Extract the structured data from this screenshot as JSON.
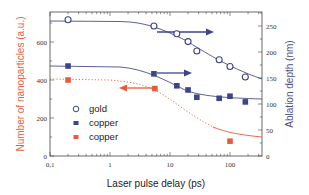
{
  "chart_data": {
    "type": "scatter",
    "title": "",
    "xlabel": "Laser pulse delay (ps)",
    "ylabel": "Number of nanoparticles (a.u.)",
    "ylabel_right": "Ablation depth (nm)",
    "xscale": "log",
    "xlim": [
      0.1,
      300
    ],
    "ylim": [
      0,
      750
    ],
    "ylim_right": [
      0,
      280
    ],
    "x_ticks": [
      "0,1",
      "1",
      "10",
      "100"
    ],
    "y_ticks_left": [
      "0",
      "200",
      "400",
      "600"
    ],
    "y_ticks_right": [
      "0",
      "50",
      "100",
      "150",
      "200",
      "250"
    ],
    "legend": [
      "gold",
      "copper",
      "copper"
    ],
    "legend_position": "lower left inside",
    "series": [
      {
        "name": "gold",
        "axis": "right",
        "marker": "open-circle",
        "color": "#3d4488",
        "x": [
          0.2,
          5.4,
          13,
          20,
          28,
          66,
          100,
          180
        ],
        "y": [
          262,
          250,
          235,
          220,
          202,
          185,
          172,
          152
        ]
      },
      {
        "name": "copper",
        "axis": "right",
        "marker": "filled-square",
        "color": "#3d4488",
        "x": [
          0.2,
          5.4,
          13,
          20,
          28,
          66,
          100,
          180
        ],
        "y": [
          173,
          158,
          135,
          127,
          113,
          111,
          115,
          104
        ]
      },
      {
        "name": "copper",
        "axis": "left",
        "marker": "filled-square",
        "color": "#ea5a3a",
        "x": [
          0.2,
          5.6,
          100
        ],
        "y": [
          400,
          355,
          78
        ]
      }
    ],
    "annotations": [
      {
        "type": "arrow",
        "direction": "right",
        "color": "#3d4488",
        "from_x": 5.4,
        "to_x": 40,
        "series": "gold",
        "meaning": "right axis"
      },
      {
        "type": "arrow",
        "direction": "right",
        "color": "#3d4488",
        "from_x": 5.4,
        "to_x": 30,
        "series": "copper (blue)",
        "meaning": "right axis"
      },
      {
        "type": "arrow",
        "direction": "left",
        "color": "#ea5a3a",
        "from_x": 5.6,
        "to_x": 1.6,
        "series": "copper (red)",
        "meaning": "left axis"
      }
    ],
    "grid": false
  },
  "colors": {
    "blue": "#3d4488",
    "red": "#ea5a3a",
    "left_label": "#e8613d",
    "right_label": "#4a4f8c"
  }
}
